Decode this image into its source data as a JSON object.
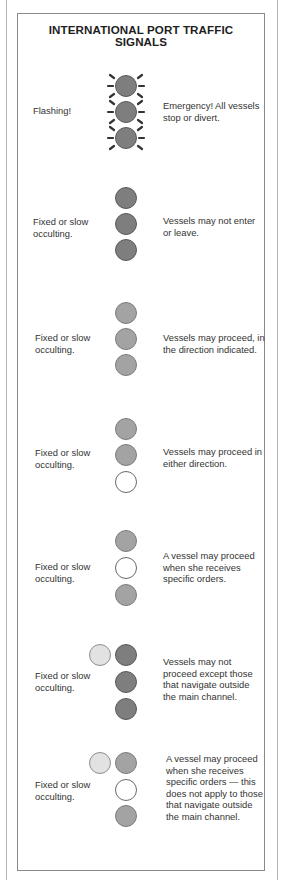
{
  "title": {
    "line1": "INTERNATIONAL PORT TRAFFIC",
    "line2": "SIGNALS"
  },
  "colors": {
    "red_light": "#7e7e7e",
    "green_light": "#a3a3a3",
    "white_light": "#ffffff",
    "yellow_light": "#e2e2e2",
    "frame": "#8a8a8a",
    "text": "#333333"
  },
  "signals": [
    {
      "mode": "Flashing!",
      "lights": [
        "red-flashing",
        "red-flashing",
        "red-flashing"
      ],
      "side_light": null,
      "meaning": "Emergency! All vessels stop or divert.",
      "meaning_lines": [
        "Emergency! All vessels",
        "stop or divert."
      ]
    },
    {
      "mode_lines": [
        "Fixed or slow",
        "occulting."
      ],
      "lights": [
        "red",
        "red",
        "red"
      ],
      "side_light": null,
      "meaning_lines": [
        "Vessels may not enter",
        "or leave."
      ]
    },
    {
      "mode_lines": [
        "Fixed or slow",
        "occulting."
      ],
      "lights": [
        "green",
        "green",
        "green"
      ],
      "side_light": null,
      "meaning_lines": [
        "Vessels may proceed, in",
        "the direction indicated."
      ]
    },
    {
      "mode_lines": [
        "Fixed or slow",
        "occulting."
      ],
      "lights": [
        "green",
        "green",
        "white"
      ],
      "side_light": null,
      "meaning_lines": [
        "Vessels may proceed in",
        "either direction."
      ]
    },
    {
      "mode_lines": [
        "Fixed or slow",
        "occulting."
      ],
      "lights": [
        "green",
        "white",
        "green"
      ],
      "side_light": null,
      "meaning_lines": [
        "A vessel may proceed",
        "when she receives",
        "specific orders."
      ]
    },
    {
      "mode_lines": [
        "Fixed or slow",
        "occulting."
      ],
      "lights": [
        "red",
        "red",
        "red"
      ],
      "side_light": "yellow",
      "meaning_lines": [
        "Vessels may not",
        "proceed except those",
        "that navigate outside",
        "the main channel."
      ]
    },
    {
      "mode_lines": [
        "Fixed or slow",
        "occulting."
      ],
      "lights": [
        "green",
        "white",
        "green"
      ],
      "side_light": "yellow",
      "meaning_lines": [
        "A vessel may proceed",
        "when she receives",
        "specific orders — this",
        "does not apply to those",
        "that navigate outside",
        "the main channel."
      ]
    }
  ]
}
